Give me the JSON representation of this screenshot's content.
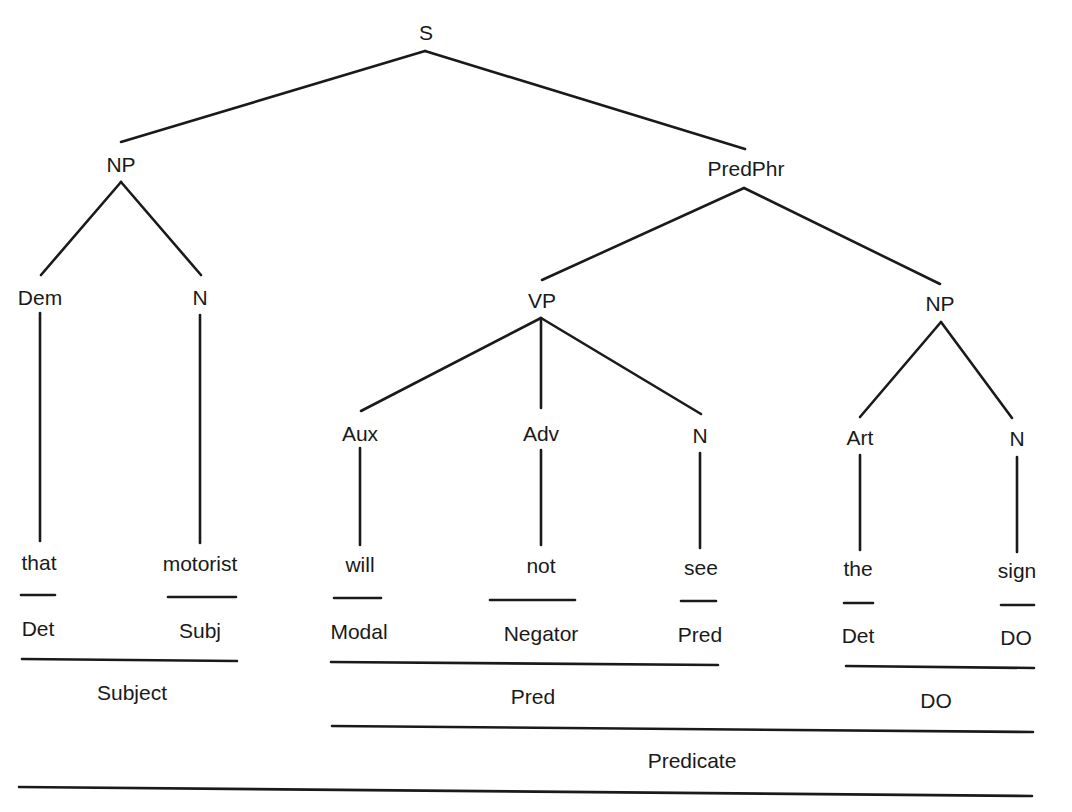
{
  "diagram": {
    "type": "syntax-tree",
    "sentence": "that motorist will not see the sign",
    "nodes": {
      "s": "S",
      "np_subj": "NP",
      "predphr": "PredPhr",
      "dem": "Dem",
      "n_subj": "N",
      "vp": "VP",
      "np_obj": "NP",
      "aux": "Aux",
      "adv": "Adv",
      "n_verb": "N",
      "art": "Art",
      "n_obj": "N"
    },
    "words": {
      "that": "that",
      "motorist": "motorist",
      "will": "will",
      "not": "not",
      "see": "see",
      "the": "the",
      "sign": "sign"
    },
    "functions": {
      "that": "Det",
      "motorist": "Subj",
      "will": "Modal",
      "not": "Negator",
      "see": "Pred",
      "the": "Det",
      "sign": "DO"
    },
    "groups": {
      "subject": "Subject",
      "pred": "Pred",
      "do": "DO",
      "predicate": "Predicate"
    },
    "edges": [
      [
        "S",
        "NP"
      ],
      [
        "S",
        "PredPhr"
      ],
      [
        "NP",
        "Dem"
      ],
      [
        "NP",
        "N"
      ],
      [
        "PredPhr",
        "VP"
      ],
      [
        "PredPhr",
        "NP"
      ],
      [
        "VP",
        "Aux"
      ],
      [
        "VP",
        "Adv"
      ],
      [
        "VP",
        "N"
      ],
      [
        "NP",
        "Art"
      ],
      [
        "NP",
        "N"
      ],
      [
        "Dem",
        "that"
      ],
      [
        "N",
        "motorist"
      ],
      [
        "Aux",
        "will"
      ],
      [
        "Adv",
        "not"
      ],
      [
        "N",
        "see"
      ],
      [
        "Art",
        "the"
      ],
      [
        "N",
        "sign"
      ]
    ]
  }
}
